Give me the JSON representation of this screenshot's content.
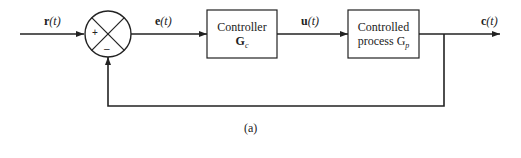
{
  "diagram": {
    "type": "feedback-control-block-diagram",
    "signals": {
      "reference": "r",
      "error": "e",
      "control": "u",
      "output": "c",
      "arg": "(t)"
    },
    "summing_junction": {
      "plus_sign": "+",
      "minus_sign": "–"
    },
    "blocks": [
      {
        "line1": "Controller",
        "line2": "G",
        "sub": "c"
      },
      {
        "line1": "Controlled",
        "line2": "process G",
        "sub": "p"
      }
    ],
    "caption": "(a)",
    "colors": {
      "stroke": "#222222",
      "background": "#ffffff"
    }
  }
}
